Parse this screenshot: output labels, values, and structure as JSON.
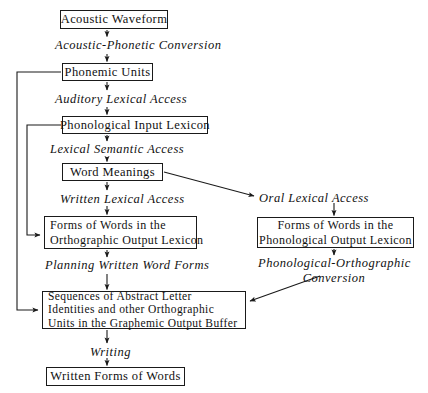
{
  "diagram": {
    "type": "flowchart",
    "background_color": "#ffffff",
    "line_color": "#1a1a1a",
    "nodes": [
      {
        "id": "acoustic-waveform",
        "label": "Acoustic  Waveform",
        "x": 60,
        "y": 10,
        "w": 108,
        "h": 19
      },
      {
        "id": "phonemic-units",
        "label": "Phonemic  Units",
        "x": 62,
        "y": 63,
        "w": 91,
        "h": 18
      },
      {
        "id": "phonological-input-lexicon",
        "label": "Phonological  Input  Lexicon",
        "x": 62,
        "y": 116,
        "w": 146,
        "h": 18
      },
      {
        "id": "word-meanings",
        "label": "Word   Meanings",
        "x": 62,
        "y": 163,
        "w": 101,
        "h": 18
      },
      {
        "id": "orthographic-output-lexicon",
        "line1": "Forms of Words in the",
        "line2": "Orthographic  Output  Lexicon",
        "x": 44,
        "y": 216,
        "w": 153,
        "h": 33
      },
      {
        "id": "phonological-output-lexicon",
        "line1": "Forms  of  Words  in  the",
        "line2": "Phonological  Output  Lexicon",
        "x": 257,
        "y": 217,
        "w": 157,
        "h": 31
      },
      {
        "id": "graphemic-output-buffer",
        "line1": "Sequences  of  Abstract  Letter",
        "line2": "Identities  and  other  Orthographic",
        "line3": "Units  in  the  Graphemic  Output  Buffer",
        "x": 42,
        "y": 291,
        "w": 204,
        "h": 38
      },
      {
        "id": "written-forms-of-words",
        "label": "Written  Forms  of  Words",
        "x": 46,
        "y": 367,
        "w": 139,
        "h": 19
      }
    ],
    "processes": [
      {
        "id": "acoustic-phonetic-conversion",
        "label": "Acoustic-Phonetic  Conversion",
        "x": 55,
        "y": 38
      },
      {
        "id": "auditory-lexical-access",
        "label": "Auditory  Lexical  Access",
        "x": 55,
        "y": 92
      },
      {
        "id": "lexical-semantic-access",
        "label": "Lexical  Semantic  Access",
        "x": 50,
        "y": 142
      },
      {
        "id": "written-lexical-access",
        "label": "Written  Lexical  Access",
        "x": 60,
        "y": 192
      },
      {
        "id": "oral-lexical-access",
        "label": "Oral Lexical Access",
        "x": 259,
        "y": 191
      },
      {
        "id": "planning-written-word-forms",
        "label": "Planning  Written  Word  Forms",
        "x": 45,
        "y": 258
      },
      {
        "id": "phonological-orthographic-conversion",
        "line1": "Phonological-Orthographic",
        "line2": "Conversion",
        "x": 258,
        "y": 256
      },
      {
        "id": "writing",
        "label": "Writing",
        "x": 90,
        "y": 345
      }
    ],
    "edges": [
      {
        "id": "edge-waveform-to-conversion",
        "from": "acoustic-waveform",
        "to": "acoustic-phonetic-conversion",
        "kind": "vertical-arrow"
      },
      {
        "id": "edge-conversion-to-phonemic",
        "from": "acoustic-phonetic-conversion",
        "to": "phonemic-units",
        "kind": "vertical-arrow"
      },
      {
        "id": "edge-phonemic-to-auditory",
        "from": "phonemic-units",
        "to": "auditory-lexical-access",
        "kind": "vertical-arrow"
      },
      {
        "id": "edge-auditory-to-input-lexicon",
        "from": "auditory-lexical-access",
        "to": "phonological-input-lexicon",
        "kind": "vertical-arrow"
      },
      {
        "id": "edge-input-lexicon-to-semantic",
        "from": "phonological-input-lexicon",
        "to": "lexical-semantic-access",
        "kind": "vertical-arrow"
      },
      {
        "id": "edge-semantic-to-word-meanings",
        "from": "lexical-semantic-access",
        "to": "word-meanings",
        "kind": "vertical-arrow"
      },
      {
        "id": "edge-word-meanings-to-written",
        "from": "word-meanings",
        "to": "written-lexical-access",
        "kind": "vertical-arrow"
      },
      {
        "id": "edge-written-to-orthographic-lexicon",
        "from": "written-lexical-access",
        "to": "orthographic-output-lexicon",
        "kind": "vertical-arrow"
      },
      {
        "id": "edge-word-meanings-to-oral",
        "from": "word-meanings",
        "to": "oral-lexical-access",
        "kind": "diagonal-arrow"
      },
      {
        "id": "edge-oral-to-phonological-lexicon",
        "from": "oral-lexical-access",
        "to": "phonological-output-lexicon",
        "kind": "vertical-arrow"
      },
      {
        "id": "edge-phonological-lexicon-to-conversion",
        "from": "phonological-output-lexicon",
        "to": "phonological-orthographic-conversion",
        "kind": "vertical-arrow"
      },
      {
        "id": "edge-conversion-to-buffer",
        "from": "phonological-orthographic-conversion",
        "to": "graphemic-output-buffer",
        "kind": "diagonal-arrow"
      },
      {
        "id": "edge-orthographic-lexicon-to-planning",
        "from": "orthographic-output-lexicon",
        "to": "planning-written-word-forms",
        "kind": "vertical-arrow"
      },
      {
        "id": "edge-planning-to-buffer",
        "from": "planning-written-word-forms",
        "to": "graphemic-output-buffer",
        "kind": "vertical-arrow"
      },
      {
        "id": "edge-buffer-to-writing",
        "from": "graphemic-output-buffer",
        "to": "writing",
        "kind": "vertical-arrow"
      },
      {
        "id": "edge-writing-to-written-forms",
        "from": "writing",
        "to": "written-forms-of-words",
        "kind": "vertical-arrow"
      },
      {
        "id": "edge-phonemic-feedback-to-buffer",
        "from": "phonemic-units",
        "to": "graphemic-output-buffer",
        "kind": "feedback-left-loop"
      },
      {
        "id": "edge-input-lexicon-feedback-to-orthographic",
        "from": "phonological-input-lexicon",
        "to": "orthographic-output-lexicon",
        "kind": "feedback-left-loop"
      }
    ]
  }
}
